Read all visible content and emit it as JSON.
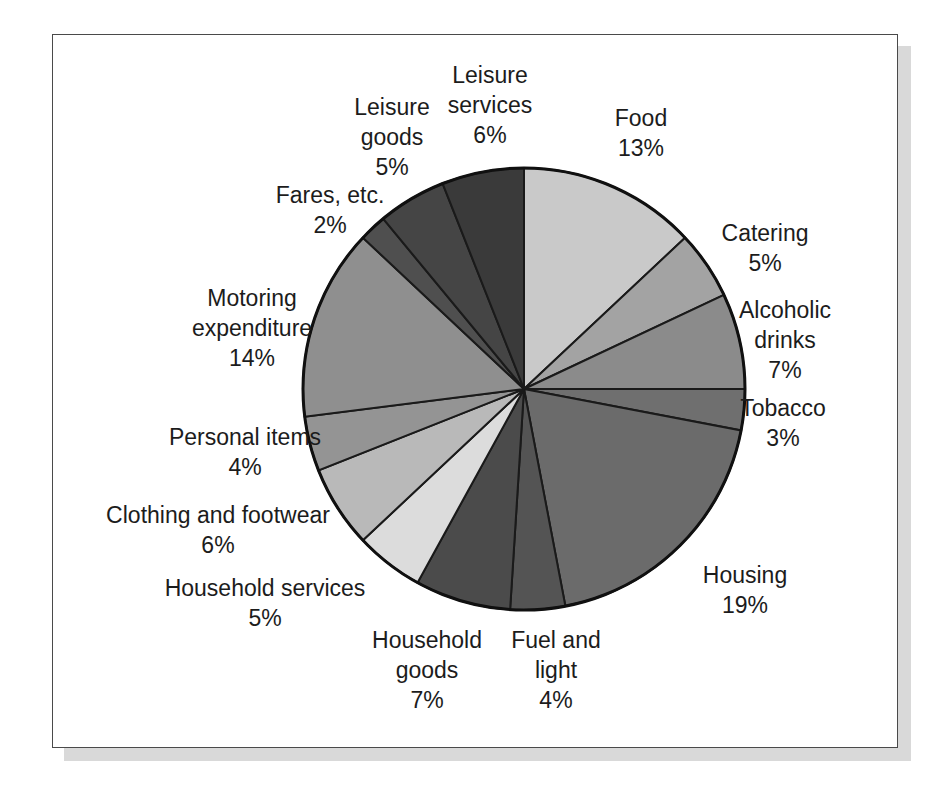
{
  "figure": {
    "frame_color": "#4a4a4a",
    "shadow_color": "#d9d9d9",
    "background": "#ffffff"
  },
  "chart_data": {
    "type": "pie",
    "title": "",
    "subtitle": "",
    "xlabel": "",
    "ylabel": "",
    "legend_position": "none",
    "grid": false,
    "units": "percent",
    "total": 100,
    "start_angle_deg": 0,
    "direction": "clockwise",
    "center": {
      "x": 524,
      "y": 389
    },
    "radius": 221,
    "categories": [
      "Food",
      "Catering",
      "Alcoholic drinks",
      "Tobacco",
      "Housing",
      "Fuel and light",
      "Household goods",
      "Household services",
      "Clothing and footwear",
      "Personal items",
      "Motoring expenditure",
      "Fares, etc.",
      "Leisure goods",
      "Leisure services"
    ],
    "values": [
      13,
      5,
      7,
      3,
      19,
      4,
      7,
      5,
      6,
      4,
      14,
      2,
      5,
      6
    ],
    "value_labels": [
      "13%",
      "5%",
      "7%",
      "3%",
      "19%",
      "4%",
      "7%",
      "5%",
      "6%",
      "4%",
      "14%",
      "2%",
      "5%",
      "6%"
    ],
    "colors": [
      "#c9c9c9",
      "#a3a3a3",
      "#8b8b8b",
      "#6f6f6f",
      "#6b6b6b",
      "#545454",
      "#4b4b4b",
      "#dcdcdc",
      "#b9b9b9",
      "#949494",
      "#8f8f8f",
      "#4f4f4f",
      "#454545",
      "#3a3a3a"
    ],
    "slice_border_color": "#1a1a1a",
    "slices": [
      {
        "label": "Food",
        "value": 13,
        "value_label": "13%",
        "color": "#c9c9c9"
      },
      {
        "label": "Catering",
        "value": 5,
        "value_label": "5%",
        "color": "#a3a3a3"
      },
      {
        "label": "Alcoholic drinks",
        "value": 7,
        "value_label": "7%",
        "color": "#8b8b8b"
      },
      {
        "label": "Tobacco",
        "value": 3,
        "value_label": "3%",
        "color": "#6f6f6f"
      },
      {
        "label": "Housing",
        "value": 19,
        "value_label": "19%",
        "color": "#6b6b6b"
      },
      {
        "label": "Fuel and light",
        "value": 4,
        "value_label": "4%",
        "color": "#545454"
      },
      {
        "label": "Household goods",
        "value": 7,
        "value_label": "7%",
        "color": "#4b4b4b"
      },
      {
        "label": "Household services",
        "value": 5,
        "value_label": "5%",
        "color": "#dcdcdc"
      },
      {
        "label": "Clothing and footwear",
        "value": 6,
        "value_label": "6%",
        "color": "#b9b9b9"
      },
      {
        "label": "Personal items",
        "value": 4,
        "value_label": "4%",
        "color": "#949494"
      },
      {
        "label": "Motoring expenditure",
        "value": 14,
        "value_label": "14%",
        "color": "#8f8f8f"
      },
      {
        "label": "Fares, etc.",
        "value": 2,
        "value_label": "2%",
        "color": "#4f4f4f"
      },
      {
        "label": "Leisure goods",
        "value": 5,
        "value_label": "5%",
        "color": "#454545"
      },
      {
        "label": "Leisure services",
        "value": 6,
        "value_label": "6%",
        "color": "#3a3a3a"
      }
    ]
  },
  "labels": {
    "food": {
      "name": "Food",
      "value": "13%"
    },
    "catering": {
      "name": "Catering",
      "value": "5%"
    },
    "alcoholic1": {
      "name": "Alcoholic",
      "name2": "drinks",
      "value": "7%"
    },
    "tobacco": {
      "name": "Tobacco",
      "value": "3%"
    },
    "housing": {
      "name": "Housing",
      "value": "19%"
    },
    "fuel": {
      "name": "Fuel and",
      "name2": "light",
      "value": "4%"
    },
    "hhgoods": {
      "name": "Household",
      "name2": "goods",
      "value": "7%"
    },
    "hhservices": {
      "name": "Household services",
      "value": "5%"
    },
    "clothing": {
      "name": "Clothing and footwear",
      "value": "6%"
    },
    "personal": {
      "name": "Personal items",
      "value": "4%"
    },
    "motoring": {
      "name": "Motoring",
      "name2": "expenditure",
      "value": "14%"
    },
    "fares": {
      "name": "Fares, etc.",
      "value": "2%"
    },
    "leisuregoods": {
      "name": "Leisure",
      "name2": "goods",
      "value": "5%"
    },
    "leisureserv": {
      "name": "Leisure",
      "name2": "services",
      "value": "6%"
    }
  }
}
